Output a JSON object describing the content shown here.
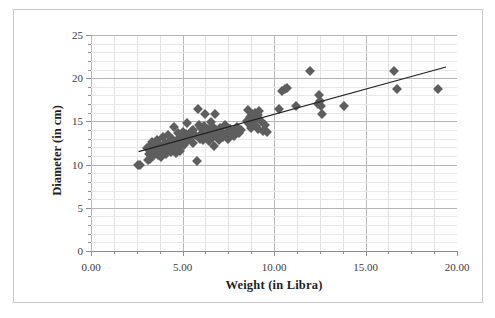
{
  "chart": {
    "type": "scatter",
    "title": "",
    "xlabel": "Weight (in Libra)",
    "ylabel": "Diameter (in cm)",
    "xlim": [
      0,
      20
    ],
    "ylim": [
      0,
      25
    ],
    "xticks": [
      "0.00",
      "5.00",
      "10.00",
      "15.00",
      "20.00"
    ],
    "xtick_values": [
      0,
      5,
      10,
      15,
      20
    ],
    "yticks": [
      "0",
      "5",
      "10",
      "15",
      "20",
      "25"
    ],
    "ytick_values": [
      0,
      5,
      10,
      15,
      20,
      25
    ],
    "grid": "both",
    "x_minor_step": 1.25,
    "y_minor_step": 1,
    "legend": "none",
    "marker_shape": "diamond",
    "marker_color": "#5e5e5e",
    "trendline_color": "#222222"
  },
  "chart_data": {
    "type": "scatter",
    "title": "",
    "xlabel": "Weight (in Libra)",
    "ylabel": "Diameter (in cm)",
    "xlim": [
      0,
      20
    ],
    "ylim": [
      0,
      25
    ],
    "xticks": [
      0,
      5,
      10,
      15,
      20
    ],
    "yticks": [
      0,
      5,
      10,
      15,
      20,
      25
    ],
    "grid": true,
    "legend": null,
    "series": [
      {
        "name": "observations",
        "marker": "diamond",
        "color": "#5e5e5e",
        "points": [
          [
            2.55,
            9.95
          ],
          [
            2.7,
            9.95
          ],
          [
            3.05,
            11.9
          ],
          [
            3.1,
            10.5
          ],
          [
            3.15,
            11.2
          ],
          [
            3.2,
            12.2
          ],
          [
            3.25,
            10.6
          ],
          [
            3.3,
            11.5
          ],
          [
            3.35,
            12.6
          ],
          [
            3.4,
            11.0
          ],
          [
            3.45,
            11.6
          ],
          [
            3.5,
            12.4
          ],
          [
            3.55,
            11.3
          ],
          [
            3.6,
            12.9
          ],
          [
            3.65,
            11.1
          ],
          [
            3.7,
            11.8
          ],
          [
            3.75,
            12.3
          ],
          [
            3.8,
            10.9
          ],
          [
            3.85,
            11.4
          ],
          [
            3.9,
            12.0
          ],
          [
            3.95,
            13.2
          ],
          [
            4.0,
            11.7
          ],
          [
            4.05,
            12.5
          ],
          [
            4.1,
            11.2
          ],
          [
            4.15,
            12.1
          ],
          [
            4.2,
            13.4
          ],
          [
            4.25,
            11.9
          ],
          [
            4.3,
            12.7
          ],
          [
            4.35,
            11.5
          ],
          [
            4.4,
            12.2
          ],
          [
            4.45,
            13.0
          ],
          [
            4.5,
            11.8
          ],
          [
            4.55,
            14.3
          ],
          [
            4.6,
            12.4
          ],
          [
            4.65,
            11.3
          ],
          [
            4.7,
            12.9
          ],
          [
            4.75,
            13.6
          ],
          [
            4.8,
            12.0
          ],
          [
            4.85,
            11.6
          ],
          [
            4.9,
            13.1
          ],
          [
            4.95,
            12.6
          ],
          [
            5.0,
            13.8
          ],
          [
            5.1,
            12.3
          ],
          [
            5.2,
            13.5
          ],
          [
            5.25,
            14.8
          ],
          [
            5.3,
            12.8
          ],
          [
            5.4,
            13.2
          ],
          [
            5.5,
            13.9
          ],
          [
            5.55,
            12.5
          ],
          [
            5.6,
            14.0
          ],
          [
            5.7,
            13.4
          ],
          [
            5.8,
            10.4
          ],
          [
            5.85,
            16.4
          ],
          [
            5.9,
            14.6
          ],
          [
            5.95,
            13.0
          ],
          [
            6.0,
            14.2
          ],
          [
            6.05,
            13.7
          ],
          [
            6.1,
            12.9
          ],
          [
            6.2,
            14.5
          ],
          [
            6.25,
            15.8
          ],
          [
            6.3,
            13.3
          ],
          [
            6.4,
            14.1
          ],
          [
            6.45,
            12.7
          ],
          [
            6.5,
            13.8
          ],
          [
            6.55,
            14.9
          ],
          [
            6.6,
            13.1
          ],
          [
            6.65,
            14.4
          ],
          [
            6.7,
            12.2
          ],
          [
            6.75,
            13.6
          ],
          [
            6.8,
            15.9
          ],
          [
            6.85,
            14.0
          ],
          [
            6.9,
            13.4
          ],
          [
            7.0,
            12.8
          ],
          [
            7.05,
            14.2
          ],
          [
            7.1,
            13.9
          ],
          [
            7.2,
            13.2
          ],
          [
            7.3,
            14.6
          ],
          [
            7.4,
            13.5
          ],
          [
            7.5,
            13.0
          ],
          [
            7.6,
            14.1
          ],
          [
            7.7,
            13.7
          ],
          [
            7.8,
            13.3
          ],
          [
            7.9,
            13.9
          ],
          [
            8.0,
            14.4
          ],
          [
            8.1,
            13.6
          ],
          [
            8.2,
            14.0
          ],
          [
            8.5,
            15.1
          ],
          [
            8.6,
            16.3
          ],
          [
            8.65,
            14.7
          ],
          [
            8.7,
            15.5
          ],
          [
            8.75,
            14.2
          ],
          [
            8.8,
            15.9
          ],
          [
            8.85,
            14.9
          ],
          [
            8.9,
            15.3
          ],
          [
            8.95,
            16.0
          ],
          [
            9.0,
            14.5
          ],
          [
            9.1,
            15.7
          ],
          [
            9.15,
            14.1
          ],
          [
            9.2,
            16.2
          ],
          [
            9.3,
            15.0
          ],
          [
            9.4,
            13.9
          ],
          [
            9.5,
            14.6
          ],
          [
            9.6,
            13.8
          ],
          [
            10.3,
            16.4
          ],
          [
            10.45,
            18.5
          ],
          [
            10.6,
            18.8
          ],
          [
            10.7,
            18.9
          ],
          [
            11.2,
            16.8
          ],
          [
            11.95,
            20.8
          ],
          [
            12.4,
            17.0
          ],
          [
            12.45,
            18.0
          ],
          [
            12.5,
            17.4
          ],
          [
            12.55,
            16.8
          ],
          [
            12.6,
            15.9
          ],
          [
            13.85,
            16.8
          ],
          [
            16.55,
            20.8
          ],
          [
            16.7,
            18.8
          ],
          [
            18.95,
            18.8
          ]
        ]
      }
    ],
    "trendline": {
      "type": "linear",
      "x_start": 2.6,
      "y_start": 11.5,
      "x_end": 19.4,
      "y_end": 21.3
    }
  }
}
